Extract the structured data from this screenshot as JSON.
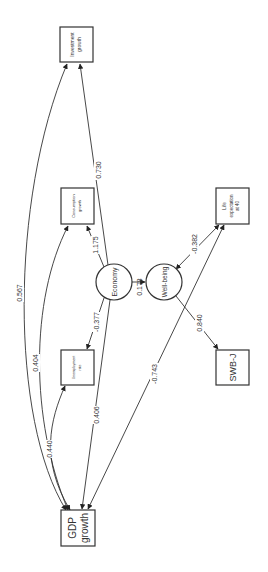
{
  "diagram": {
    "type": "structural-equation-path-diagram",
    "orientation": "rotated-90-ccw",
    "nodes": {
      "investment": {
        "label_line1": "Investment",
        "label_line2": "growth",
        "shape": "box"
      },
      "consumption": {
        "label_line1": "Consumption",
        "label_line2": "growth",
        "shape": "box"
      },
      "unemployment": {
        "label_line1": "Unemployment",
        "label_line2": "rate",
        "shape": "box"
      },
      "life_expectancy": {
        "label_line1": "Life",
        "label_line2": "expectation",
        "label_line3": "at 40",
        "shape": "box"
      },
      "swb": {
        "label": "SWB-J",
        "shape": "box"
      },
      "gdp": {
        "label_line1": "GDP",
        "label_line2": "growth",
        "shape": "box"
      },
      "economy": {
        "label": "Economy",
        "shape": "circle"
      },
      "wellbeing": {
        "label": "Well-being",
        "shape": "circle"
      }
    },
    "edges": [
      {
        "from": "Economy",
        "to": "Investment growth",
        "value": "0.730"
      },
      {
        "from": "Economy",
        "to": "Consumption growth",
        "value": "1.175"
      },
      {
        "from": "Economy",
        "to": "Unemployment rate",
        "value": "-0.377"
      },
      {
        "from": "Economy",
        "to": "GDP growth",
        "value": "0.406"
      },
      {
        "from": "Economy",
        "to": "Well-being",
        "value": "0.178"
      },
      {
        "from": "Well-being",
        "to": "Life expectation at 40",
        "value": "-0.382"
      },
      {
        "from": "Well-being",
        "to": "SWB-J",
        "value": "0.840"
      },
      {
        "from": "GDP growth",
        "to": "Investment growth",
        "value": "0.567"
      },
      {
        "from": "GDP growth",
        "to": "Consumption growth",
        "value": "0.404"
      },
      {
        "from": "GDP growth",
        "to": "Unemployment rate",
        "value": "0.440"
      },
      {
        "from": "GDP growth",
        "to": "Life expectation at 40",
        "value": "-0.743"
      }
    ]
  }
}
